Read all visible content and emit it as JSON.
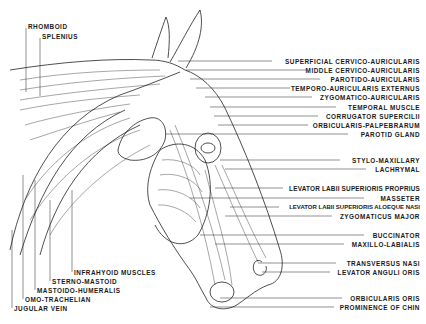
{
  "figure": {
    "line_color": "#222222",
    "background": "#ffffff"
  },
  "labels_left_top": [
    {
      "text": "RHOMBOID",
      "x": 28,
      "y": 26
    },
    {
      "text": "SPLENIUS",
      "x": 42,
      "y": 36
    }
  ],
  "labels_right": [
    {
      "text": "SUPERFICIAL CERVICO-AURICULARIS",
      "y": 58
    },
    {
      "text": "MIDDLE CERVICO-AURICULARIS",
      "y": 67
    },
    {
      "text": "PAROTIDO-AURICULARIS",
      "y": 76
    },
    {
      "text": "TEMPORO-AURICULARIS EXTERNUS",
      "y": 85
    },
    {
      "text": "ZYGOMATICO-AURICULARIS",
      "y": 94
    },
    {
      "text": "TEMPORAL MUSCLE",
      "y": 104
    },
    {
      "text": "CORRUGATOR SUPERCILII",
      "y": 113
    },
    {
      "text": "ORBICULARIS-PALPEBRARUM",
      "y": 122
    },
    {
      "text": "PAROTID GLAND",
      "y": 131
    },
    {
      "text": "STYLO-MAXILLARY",
      "y": 157
    },
    {
      "text": "LACHRYMAL",
      "y": 166
    },
    {
      "text": "LEVATOR LABII SUPERIORIS PROPRIUS",
      "y": 185
    },
    {
      "text": "MASSETER",
      "y": 195
    },
    {
      "text": "LEVATOR LABII SUPERIORIS ALOEQUE NASI",
      "y": 204
    },
    {
      "text": "ZYGOMATICUS MAJOR",
      "y": 213
    },
    {
      "text": "BUCCINATOR",
      "y": 232
    },
    {
      "text": "MAXILLO-LABIALIS",
      "y": 241
    },
    {
      "text": "TRANSVERSUS NASI",
      "y": 260
    },
    {
      "text": "LEVATOR ANGULI ORIS",
      "y": 269
    },
    {
      "text": "ORBICULARIS ORIS",
      "y": 295
    },
    {
      "text": "PROMINENCE OF CHIN",
      "y": 304
    }
  ],
  "labels_left_bottom": [
    {
      "text": "INFRAHYOID MUSCLES",
      "x": 74,
      "y": 272
    },
    {
      "text": "STERNO-MASTOID",
      "x": 52,
      "y": 281
    },
    {
      "text": "MASTOIDO-HUMERALIS",
      "x": 37,
      "y": 290
    },
    {
      "text": "OMO-TRACHELIAN",
      "x": 25,
      "y": 299
    },
    {
      "text": "JUGULAR VEIN",
      "x": 14,
      "y": 308
    }
  ]
}
